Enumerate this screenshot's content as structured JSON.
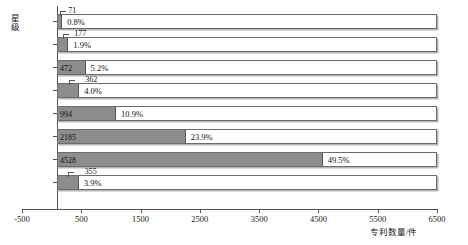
{
  "chart_data": {
    "type": "bar",
    "orientation": "horizontal",
    "title": "",
    "xlabel": "专利数量/件",
    "ylabel": "星级",
    "categories": [
      "5星",
      "4.5星",
      "4星",
      "3.5星",
      "3星",
      "2.5星",
      "2星",
      "1.5星"
    ],
    "values": [
      71,
      177,
      472,
      362,
      994,
      2185,
      4528,
      355
    ],
    "percent_labels": [
      "0.8%",
      "1.9%",
      "5.2%",
      "4.0%",
      "10.9%",
      "23.9%",
      "49.5%",
      "3.9%"
    ],
    "value_labels": [
      "71",
      "177",
      "472",
      "362",
      "994",
      "2185",
      "4528",
      "355"
    ],
    "xlim": [
      -500,
      6500
    ],
    "xticks": [
      -500,
      500,
      1500,
      2500,
      3500,
      4500,
      5500,
      6500
    ],
    "xtick_labels": [
      "-500",
      "500",
      "1500",
      "2500",
      "3500",
      "4500",
      "5500",
      "6500"
    ],
    "grid": false,
    "legend": null,
    "series": [
      {
        "name": "专利数量",
        "values": [
          71,
          177,
          472,
          362,
          994,
          2185,
          4528,
          355
        ]
      }
    ],
    "bar_fill_color": "#8d8d8d",
    "bar_outline_color": "#6b6b6b",
    "background_color": "#ffffff"
  }
}
